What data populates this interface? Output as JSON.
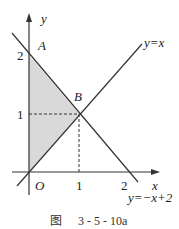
{
  "figure": {
    "caption_prefix": "图",
    "caption_number": "3 - 5 - 10a",
    "axes": {
      "x_label": "x",
      "y_label": "y",
      "origin_label": "O"
    },
    "ticks": {
      "x": [
        "1",
        "2"
      ],
      "y": [
        "1",
        "2"
      ]
    },
    "points": {
      "A": "A",
      "B": "B"
    },
    "lines": [
      {
        "label": "y=x",
        "equation": "y = x"
      },
      {
        "label": "y=−x+2",
        "equation": "y = -x + 2"
      }
    ],
    "shaded_region": "triangle O-A(0,2)-B(1,1)",
    "colors": {
      "stroke": "#333333",
      "shade": "#d9d9d9"
    }
  }
}
